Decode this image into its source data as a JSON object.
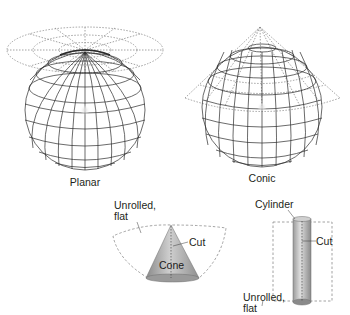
{
  "figure": {
    "type": "map-projection-surfaces",
    "colors": {
      "line": "#2b2b2b",
      "dashed": "#8c8c8c",
      "shape_fill": "#bdbdbd",
      "shape_dark": "#7a7a7a",
      "text": "#231f20"
    }
  },
  "globes": [
    {
      "label": "Planar",
      "projection_surface": "plane touching pole"
    },
    {
      "label": "Conic",
      "projection_surface": "cone over globe"
    }
  ],
  "surfaces": {
    "cone": {
      "name_label": "Cone",
      "cut_label": "Cut",
      "unrolled_label_line1": "Unrolled,",
      "unrolled_label_line2": "flat"
    },
    "cylinder": {
      "name_label": "Cylinder",
      "cut_label": "Cut",
      "unrolled_label_line1": "Unrolled,",
      "unrolled_label_line2": "flat"
    }
  }
}
